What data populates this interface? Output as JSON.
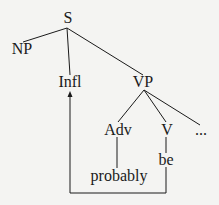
{
  "diagram": {
    "type": "syntax-tree",
    "nodes": {
      "s": "S",
      "np": "NP",
      "infl": "Infl",
      "vp": "VP",
      "adv": "Adv",
      "v": "V",
      "ellipsis": "...",
      "probably": "probably",
      "be": "be"
    },
    "edges": [
      [
        "S",
        "NP"
      ],
      [
        "S",
        "Infl"
      ],
      [
        "S",
        "VP"
      ],
      [
        "VP",
        "Adv"
      ],
      [
        "VP",
        "V"
      ],
      [
        "VP",
        "..."
      ],
      [
        "Adv",
        "probably"
      ],
      [
        "V",
        "be"
      ]
    ],
    "movement_arrow": {
      "from": "be",
      "to": "Infl"
    },
    "colors": {
      "line": "#1a1a1a",
      "background": "#f4f4f2"
    }
  }
}
